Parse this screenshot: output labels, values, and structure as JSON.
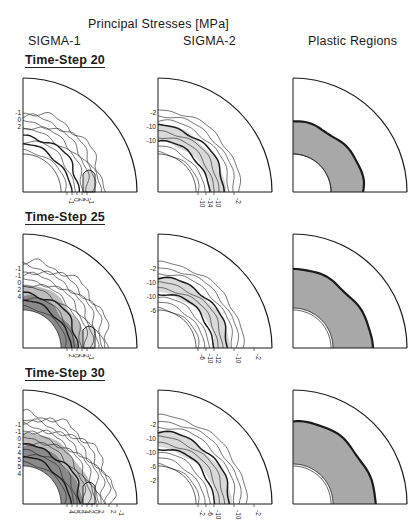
{
  "figure": {
    "title": "Principal Stresses [MPa]",
    "columns": [
      "SIGMA-1",
      "SIGMA-2",
      "Plastic Regions"
    ],
    "rows": [
      {
        "label": "Time-Step 20",
        "sigma1": {
          "left_labels": [
            "-1",
            "0",
            "2"
          ],
          "bottom_labels": [
            "-1",
            "0",
            "2",
            "2",
            "-1"
          ]
        },
        "sigma2": {
          "left_labels": [
            "-2",
            "-10",
            "-10"
          ],
          "bottom_labels": [
            "-10",
            "-14",
            "-10",
            "-2"
          ]
        },
        "plastic": {
          "description": "shaded annular plastic zone near cavity"
        }
      },
      {
        "label": "Time-Step 25",
        "sigma1": {
          "left_labels": [
            "-1",
            "-1",
            "0",
            "2",
            "4"
          ],
          "bottom_labels": [
            "2",
            "0",
            "2",
            "2",
            "-1"
          ]
        },
        "sigma2": {
          "left_labels": [
            "-2",
            "-10",
            "-10",
            "-6"
          ],
          "bottom_labels": [
            "-6",
            "-10",
            "-12",
            "-10",
            "-2"
          ]
        },
        "plastic": {
          "description": "shaded annular plastic zone, wider"
        }
      },
      {
        "label": "Time-Step 30",
        "sigma1": {
          "left_labels": [
            "-1",
            "-1",
            "0",
            "2",
            "4",
            "5",
            "5",
            "4"
          ],
          "bottom_labels": [
            "4",
            "5",
            "5",
            "4",
            "2",
            "0",
            "2",
            "2",
            "-1"
          ]
        },
        "sigma2": {
          "left_labels": [
            "-2",
            "-10",
            "-10",
            "-6",
            "-2"
          ],
          "bottom_labels": [
            "-2",
            "-6",
            "-10",
            "-10",
            "-2"
          ]
        },
        "plastic": {
          "description": "shaded annular plastic zone, widest"
        }
      }
    ]
  },
  "colors": {
    "ink": "#1a1a1a",
    "light_fill": "#d9d9d9",
    "mid_fill": "#bdbdbd",
    "dark_fill": "#8a8a8a",
    "plastic_fill": "#a8a8a8"
  }
}
